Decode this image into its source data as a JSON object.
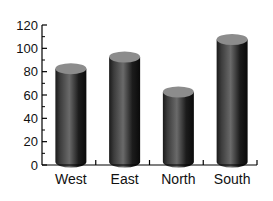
{
  "chart_data": {
    "type": "bar",
    "style": "3d-cylinder",
    "title": "",
    "xlabel": "",
    "ylabel": "",
    "categories": [
      "West",
      "East",
      "North",
      "South"
    ],
    "values": [
      80,
      90,
      60,
      105
    ],
    "ylim": [
      0,
      120
    ],
    "yticks": [
      0,
      20,
      40,
      60,
      80,
      100,
      120
    ],
    "grid": false,
    "legend": null,
    "colors": {
      "bar_body": "#2a2a2a",
      "bar_top": "#8c8c8c",
      "axis": "#000000"
    }
  }
}
